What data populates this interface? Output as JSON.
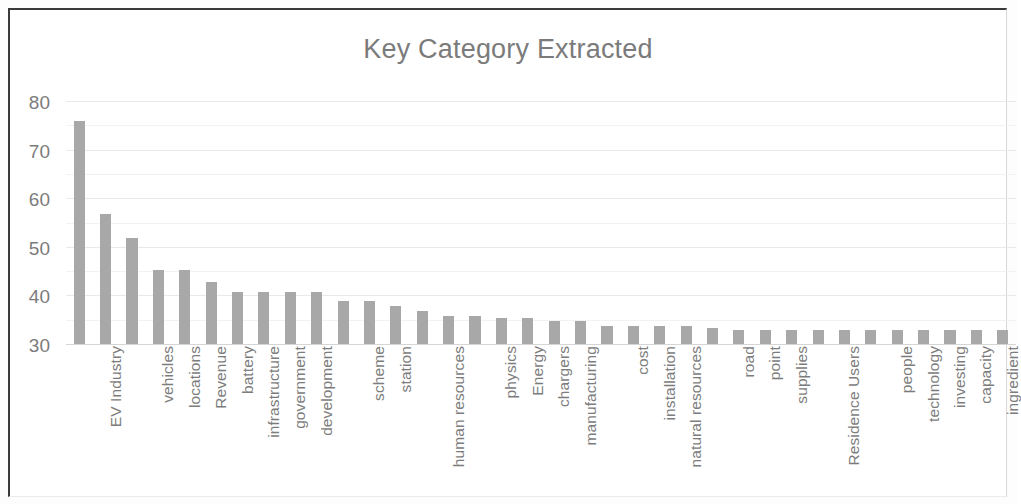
{
  "chart_title": "Key Category Extracted",
  "axis": {
    "y_ticks": [
      "80",
      "70",
      "60",
      "50",
      "40",
      "30"
    ],
    "y_min": 30,
    "y_max": 80
  },
  "colors": {
    "bar": "#a8a8a8",
    "title_text": "#7b7b7b",
    "tick_text": "#7c7c7c",
    "gridline": "#e9e9e9",
    "frame_border": "#3a3a3a",
    "background": "#ffffff"
  },
  "chart_data": {
    "type": "bar",
    "title": "Key Category Extracted",
    "xlabel": "",
    "ylabel": "",
    "ylim": [
      30,
      80
    ],
    "yticks": [
      30,
      40,
      50,
      60,
      70,
      80
    ],
    "grid": true,
    "legend": false,
    "orientation": "vertical",
    "tick_label_rotation": 90,
    "note": "Bars are clipped at the value-axis minimum of 30; some category tick labels are skipped by the chart renderer and are shown as empty strings.",
    "categories": [
      "",
      "EV Industry",
      "",
      "vehicles",
      "locations",
      "Revenue",
      "battery",
      "infrastructure",
      "government",
      "development",
      "",
      "scheme",
      "station",
      "",
      "human resources",
      "",
      "physics",
      "Energy",
      "chargers",
      "manufacturing",
      "",
      "cost",
      "installation",
      "natural resources",
      "",
      "road",
      "point",
      "supplies",
      "",
      "Residence Users",
      "",
      "people",
      "technology",
      "investing",
      "capacity",
      "ingredient"
    ],
    "values": [
      76,
      57,
      52,
      45.5,
      45.5,
      43,
      41,
      41,
      41,
      41,
      39,
      39,
      38,
      37,
      36,
      36,
      35.5,
      35.5,
      35,
      35,
      34,
      34,
      34,
      34,
      33.5,
      33,
      33,
      33,
      33,
      33,
      33,
      33,
      33,
      33,
      33,
      33
    ]
  }
}
